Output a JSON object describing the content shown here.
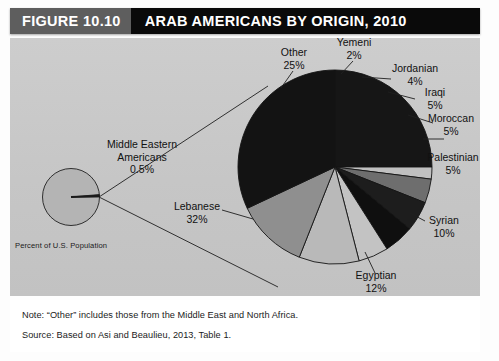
{
  "figure": {
    "number_label": "FIGURE 10.10",
    "title": "ARAB AMERICANS BY ORIGIN, 2010"
  },
  "inset": {
    "label_line1": "Middle Eastern",
    "label_line2": "Americans",
    "label_pct": "0.5%",
    "axis_note": "Percent of U.S. Population"
  },
  "notes": {
    "note": "Note: “Other” includes those from the Middle East and North Africa.",
    "source": "Source: Based on Asi and Beaulieu, 2013, Table 1."
  },
  "labels": {
    "other_name": "Other",
    "other_pct": "25%",
    "yemeni_name": "Yemeni",
    "yemeni_pct": "2%",
    "jordanian_name": "Jordanian",
    "jordanian_pct": "4%",
    "iraqi_name": "Iraqi",
    "iraqi_pct": "5%",
    "moroccan_name": "Moroccan",
    "moroccan_pct": "5%",
    "palestinian_name": "Palestinian",
    "palestinian_pct": "5%",
    "syrian_name": "Syrian",
    "syrian_pct": "10%",
    "egyptian_name": "Egyptian",
    "egyptian_pct": "12%",
    "lebanese_name": "Lebanese",
    "lebanese_pct": "32%"
  },
  "colors": {
    "header_black": "#0a0a0a",
    "header_gray": "#5e5e5e",
    "panel_gray": "#c9c9c9",
    "inset_fill": "#b4b4b4",
    "stroke": "#1a1a1a",
    "text": "#111111"
  },
  "chart_data": {
    "type": "pie",
    "title": "ARAB AMERICANS BY ORIGIN, 2010",
    "subtitle": "Percent of U.S. Population",
    "unit": "percent",
    "start_angle_deg": 0,
    "direction": "clockwise",
    "legend": "none",
    "labels_position": "outside-with-leader-lines",
    "categories": [
      "Other",
      "Yemeni",
      "Jordanian",
      "Iraqi",
      "Moroccan",
      "Palestinian",
      "Syrian",
      "Egyptian",
      "Lebanese"
    ],
    "values": [
      25,
      2,
      4,
      5,
      5,
      5,
      10,
      12,
      32
    ],
    "slice_colors": [
      "#161616",
      "#c0c0c0",
      "#6e6e6e",
      "#1d1d1d",
      "#0f0f0f",
      "#c3c3c3",
      "#b9b9b9",
      "#8f8f8f",
      "#131313"
    ],
    "inset": {
      "type": "pie",
      "name": "Middle Eastern Americans",
      "value": 0.5,
      "remainder": 99.5,
      "label": "Middle Eastern Americans 0.5%",
      "axis_note": "Percent of U.S. Population"
    },
    "annotations": [
      "Note: “Other” includes those from the Middle East and North Africa.",
      "Source: Based on Asi and Beaulieu, 2013, Table 1."
    ]
  }
}
